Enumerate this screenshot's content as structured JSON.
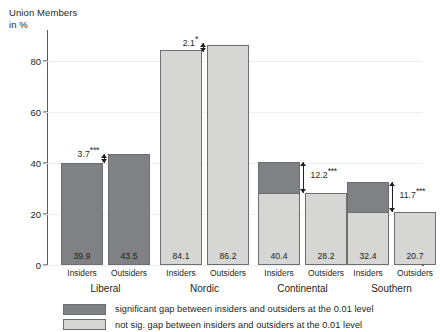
{
  "chart_data": {
    "type": "bar",
    "title": "",
    "ylabel": "Union Members\nin %",
    "xlabel": "",
    "ylim": [
      0,
      92
    ],
    "yticks": [
      0,
      20,
      40,
      60,
      80
    ],
    "ytick_labels": [
      "0",
      "20",
      "40",
      "60",
      "80"
    ],
    "grid": false,
    "categories": [
      "Liberal",
      "Nordic",
      "Continental",
      "Southern"
    ],
    "subcategories": [
      "Insiders",
      "Outsiders"
    ],
    "series": [
      {
        "name": "Insiders",
        "values": [
          39.9,
          84.1,
          40.4,
          32.4
        ]
      },
      {
        "name": "Outsiders",
        "values": [
          43.5,
          86.2,
          28.2,
          20.7
        ]
      }
    ],
    "groups": [
      {
        "name": "Liberal",
        "significant": false,
        "gap_label": "3.7",
        "gap_stars": "***",
        "gap_value": 3.7,
        "bars": [
          {
            "label": "Insiders",
            "value": 39.9,
            "value_label": "39.9",
            "fill": "dark"
          },
          {
            "label": "Outsiders",
            "value": 43.5,
            "value_label": "43.5",
            "fill": "dark"
          }
        ]
      },
      {
        "name": "Nordic",
        "significant": false,
        "gap_label": "2.1",
        "gap_stars": "*",
        "gap_value": 2.1,
        "bars": [
          {
            "label": "Insiders",
            "value": 84.1,
            "value_label": "84.1",
            "fill": "light"
          },
          {
            "label": "Outsiders",
            "value": 86.2,
            "value_label": "86.2",
            "fill": "light"
          }
        ]
      },
      {
        "name": "Continental",
        "significant": true,
        "gap_label": "12.2",
        "gap_stars": "***",
        "gap_value": 12.2,
        "bars": [
          {
            "label": "Insiders",
            "value": 40.4,
            "value_label": "40.4",
            "fill": "split",
            "cap_from": 28.2
          },
          {
            "label": "Outsiders",
            "value": 28.2,
            "value_label": "28.2",
            "fill": "light"
          }
        ]
      },
      {
        "name": "Southern",
        "significant": true,
        "gap_label": "11.7",
        "gap_stars": "***",
        "gap_value": 11.7,
        "bars": [
          {
            "label": "Insiders",
            "value": 32.4,
            "value_label": "32.4",
            "fill": "split",
            "cap_from": 20.7
          },
          {
            "label": "Outsiders",
            "value": 20.7,
            "value_label": "20.7",
            "fill": "light"
          }
        ]
      }
    ],
    "legend": {
      "position": "bottom",
      "entries": [
        {
          "swatch": "dark",
          "label": "significant gap between insiders and outsiders at the 0.01 level"
        },
        {
          "swatch": "light",
          "label": "not sig. gap between insiders and outsiders at the 0.01 level"
        }
      ]
    },
    "colors": {
      "dark": "#808184",
      "light": "#d6d7d4",
      "cap": "#58595b",
      "axis": "#58595b",
      "text": "#231f20"
    }
  }
}
